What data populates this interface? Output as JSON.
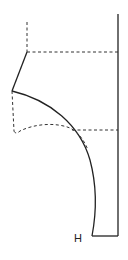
{
  "diagram": {
    "type": "pattern-draft",
    "colors": {
      "background": "#ffffff",
      "line": "#222222",
      "dashed": "#333333"
    },
    "labels": [
      {
        "id": "point-h",
        "text": "H",
        "x": 74,
        "y": 233
      }
    ],
    "solid_lines": {
      "right_edge": {
        "x1": 118,
        "y1": 14,
        "x2": 118,
        "y2": 236
      },
      "bottom_edge": {
        "x1": 92,
        "y1": 236,
        "x2": 118,
        "y2": 236
      },
      "upper_slant": {
        "x1": 27,
        "y1": 52,
        "x2": 12,
        "y2": 91
      },
      "main_curve": "M12,91 C50,100 80,125 90,160 C98,190 96,215 92,236"
    },
    "dashed_lines": {
      "top_vertical": {
        "x1": 27,
        "y1": 22,
        "x2": 27,
        "y2": 52
      },
      "top_horizontal": {
        "x1": 27,
        "y1": 52,
        "x2": 118,
        "y2": 52
      },
      "lower_horizontal": {
        "x1": 72,
        "y1": 130,
        "x2": 118,
        "y2": 130
      },
      "left_vertical": {
        "x1": 12,
        "y1": 91,
        "x2": 14,
        "y2": 131
      },
      "lower_curve": "M14,131 C15,134 18,133 20,131 C34,124 55,122 70,128 C78,132 84,140 88,150"
    }
  }
}
